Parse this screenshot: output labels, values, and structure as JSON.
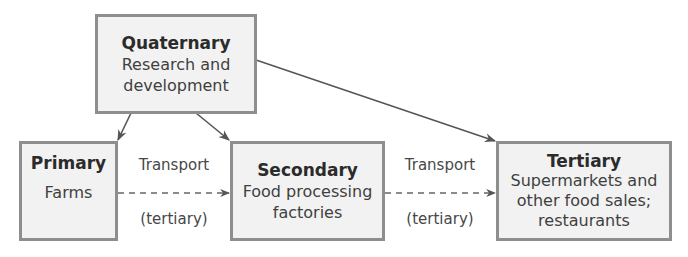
{
  "diagram": {
    "nodes": {
      "quaternary": {
        "title": "Quaternary",
        "lines": [
          "Research and",
          "development"
        ]
      },
      "primary": {
        "title": "Primary",
        "lines": [
          "Farms"
        ]
      },
      "secondary": {
        "title": "Secondary",
        "lines": [
          "Food processing",
          "factories"
        ]
      },
      "tertiary": {
        "title": "Tertiary",
        "lines": [
          "Supermarkets and",
          "other food sales;",
          "restaurants"
        ]
      }
    },
    "edges": [
      {
        "from": "quaternary",
        "to": "primary",
        "style": "solid"
      },
      {
        "from": "quaternary",
        "to": "secondary",
        "style": "solid"
      },
      {
        "from": "quaternary",
        "to": "tertiary",
        "style": "solid"
      },
      {
        "from": "primary",
        "to": "secondary",
        "style": "dashed",
        "label_top": "Transport",
        "label_bottom": "(tertiary)"
      },
      {
        "from": "secondary",
        "to": "tertiary",
        "style": "dashed",
        "label_top": "Transport",
        "label_bottom": "(tertiary)"
      }
    ],
    "colors": {
      "box_fill": "#f2f2f2",
      "box_border": "#8e8e8e",
      "arrow": "#555555",
      "text": "#3a3a3a"
    }
  }
}
